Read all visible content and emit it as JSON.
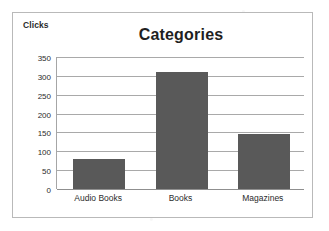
{
  "chart_data": {
    "type": "bar",
    "title": "Categories",
    "xlabel": "",
    "ylabel": "Clicks",
    "categories": [
      "Audio Books",
      "Books",
      "Magazines"
    ],
    "values": [
      80,
      310,
      145
    ],
    "ylim": [
      0,
      350
    ],
    "yticks": [
      "350",
      "300",
      "250",
      "200",
      "150",
      "100",
      "50",
      "0"
    ],
    "ytick_values": [
      350,
      300,
      250,
      200,
      150,
      100,
      50,
      0
    ],
    "grid": true,
    "legend": "none",
    "colors": {
      "bar": "#595959",
      "gridline": "#a9a9a9",
      "axis": "#8f8f8f",
      "border": "#b9b9b9",
      "text": "#2b2b2b",
      "title_text": "#1f1f1f",
      "background": "#ffffff"
    }
  }
}
